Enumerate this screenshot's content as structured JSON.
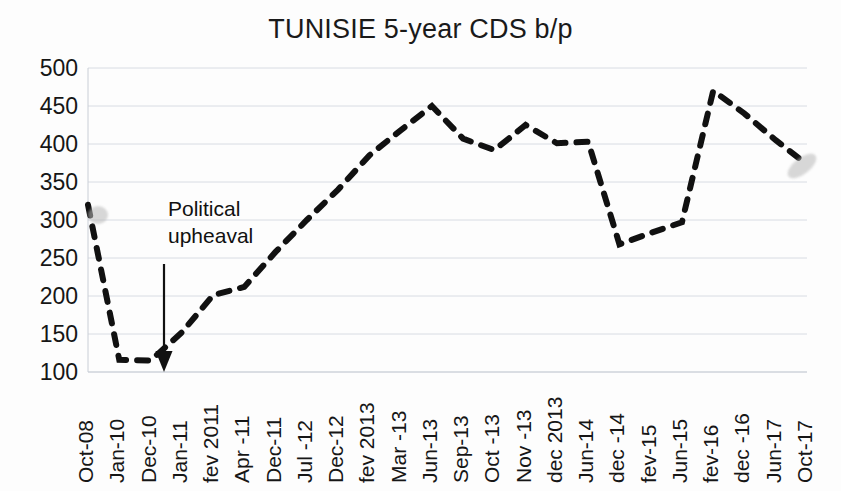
{
  "chart_data": {
    "type": "line",
    "title": "TUNISIE 5-year CDS b/p",
    "xlabel": "",
    "ylabel": "",
    "ylim": [
      100,
      500
    ],
    "ytick_step": 50,
    "yticks": [
      "500",
      "450",
      "400",
      "350",
      "300",
      "250",
      "200",
      "150",
      "100"
    ],
    "grid": true,
    "legend": "none",
    "line_style": "dashed",
    "line_color": "#111111",
    "categories": [
      "Oct-08",
      "Jan-10",
      "Dec-10",
      "Jan-11",
      "fev 2011",
      "Apr -11",
      "Dec-11",
      "Jul -12",
      "Dec-12",
      "fev 2013",
      "Mar -13",
      "Jun-13",
      "Sep-13",
      "Oct -13",
      "Nov -13",
      "dec 2013",
      "Jun-14",
      "dec -14",
      "fev-15",
      "Jun-15",
      "fev-16",
      "dec -16",
      "Jun-17",
      "Oct-17"
    ],
    "values": [
      320,
      116,
      115,
      152,
      201,
      212,
      258,
      300,
      340,
      385,
      418,
      450,
      407,
      392,
      425,
      401,
      403,
      268,
      283,
      297,
      470,
      440,
      405,
      373
    ],
    "annotations": [
      {
        "text_line1": "Political",
        "text_line2": "upheaval",
        "points_to_category": "Dec-10",
        "arrow": "down"
      }
    ]
  },
  "chart": {
    "title": "TUNISIE 5-year CDS b/p"
  },
  "annotation": {
    "line1": "Political",
    "line2": "upheaval"
  }
}
